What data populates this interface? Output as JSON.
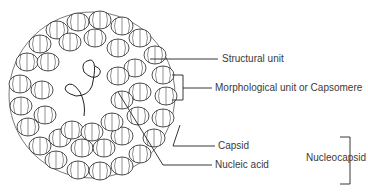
{
  "diagram": {
    "labels": {
      "structural_unit": "Structural unit",
      "morphological_unit": "Morphological unit or Capsomere",
      "capsid": "Capsid",
      "nucleic_acid": "Nucleic acid",
      "nucleocapsid": "Nucleocapsid"
    },
    "colors": {
      "line": "#222222",
      "text": "#3a3a3a",
      "background": "#ffffff"
    }
  }
}
